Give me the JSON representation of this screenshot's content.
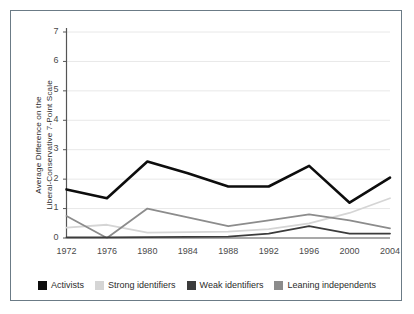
{
  "chart_data": {
    "type": "line",
    "title": "",
    "subtitle": "",
    "xlabel": "",
    "ylabel": "Average  Difference on the\nLiberal-Conservative 7-Point Scale",
    "ylabel_line1": "Average  Difference on the",
    "ylabel_line2": "Liberal-Conservative 7-Point Scale",
    "x": [
      1972,
      1976,
      1980,
      1984,
      1988,
      1992,
      1996,
      2000,
      2004
    ],
    "categories": [
      "1972",
      "1976",
      "1980",
      "1984",
      "1988",
      "1992",
      "1996",
      "2000",
      "2004"
    ],
    "xlim": [
      1972,
      2004
    ],
    "ylim": [
      0,
      7
    ],
    "yticks": [
      0,
      1,
      2,
      3,
      4,
      5,
      6,
      7
    ],
    "ytick_labels": [
      "0",
      "1",
      "2",
      "3",
      "4",
      "5",
      "6",
      "7"
    ],
    "grid": true,
    "grid_axis": "y",
    "grid_color": "#e8e8e8",
    "legend_position": "bottom",
    "series": [
      {
        "name": "Activists",
        "color": "#0d0d0d",
        "width": 2.6,
        "values": [
          1.65,
          1.35,
          2.6,
          2.2,
          1.75,
          1.75,
          2.45,
          1.2,
          2.05
        ]
      },
      {
        "name": "Strong identifiers",
        "color": "#d5d5d5",
        "width": 1.8,
        "values": [
          0.35,
          0.45,
          0.18,
          0.2,
          0.22,
          0.3,
          0.5,
          0.85,
          1.35
        ]
      },
      {
        "name": "Weak identifiers",
        "color": "#3c3c3c",
        "width": 1.8,
        "values": [
          0.02,
          0.02,
          0.03,
          0.04,
          0.05,
          0.15,
          0.4,
          0.15,
          0.15
        ]
      },
      {
        "name": "Leaning independents",
        "color": "#8c8c8c",
        "width": 1.8,
        "values": [
          0.75,
          0.0,
          1.0,
          0.7,
          0.4,
          0.6,
          0.8,
          0.6,
          0.33
        ]
      }
    ]
  },
  "legend": {
    "items": [
      {
        "label": "Activists",
        "color": "#0d0d0d"
      },
      {
        "label": "Strong identifiers",
        "color": "#d5d5d5"
      },
      {
        "label": "Weak identifiers",
        "color": "#3c3c3c"
      },
      {
        "label": "Leaning independents",
        "color": "#8c8c8c"
      }
    ]
  },
  "style": {
    "frame_border": "#6b7b86",
    "axis_color": "#555555",
    "background": "#ffffff",
    "text_color": "#2b2b2b"
  }
}
